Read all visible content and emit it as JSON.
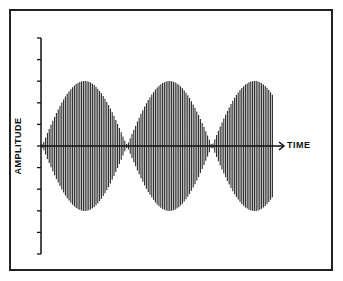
{
  "chart_data": {
    "type": "line",
    "title": "",
    "xlabel": "TIME",
    "ylabel": "AMPLITUDE",
    "grid": false,
    "legend": null,
    "y_ticks_count": 11,
    "y_tick_labels": [],
    "x_tick_labels": [],
    "envelope": {
      "shape": "abs-cosine",
      "lobes": 3,
      "node_positions_relative": [
        0.0,
        0.36,
        0.72
      ],
      "peak_positions_relative": [
        0.18,
        0.54,
        0.9
      ],
      "peak_amplitude_relative": 0.6,
      "third_lobe_truncated": true
    },
    "ylim": [
      -1,
      1
    ]
  },
  "labels": {
    "y_axis": "AMPLITUDE",
    "x_axis": "TIME"
  },
  "colors": {
    "wave": "#2a2a2a",
    "axis": "#111111",
    "frame": "#222222",
    "background": "#ffffff"
  }
}
